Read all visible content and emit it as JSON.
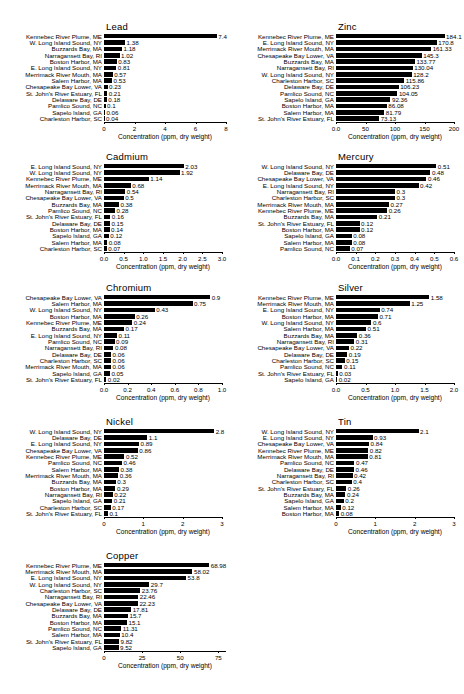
{
  "figure": {
    "axis_title": "Concentration (ppm, dry weight)",
    "bar_color": "#000000"
  },
  "chart_data": [
    {
      "type": "bar",
      "title": "Lead",
      "orientation": "horizontal",
      "xlabel": "Concentration (ppm, dry weight)",
      "ylabel": "",
      "xlim": [
        0,
        8
      ],
      "xticks": [
        0,
        2,
        4,
        6,
        8
      ],
      "xticklabels": [
        "0",
        "2",
        "4",
        "6",
        "8"
      ],
      "grid": false,
      "legend": "none",
      "categories": [
        "Kennebec River Plume, ME",
        "W. Long Island Sound, NY",
        "Buzzards Bay, MA",
        "Narragansett Bay, RI",
        "Boston Harbor, MA",
        "E. Long Island Sound, NY",
        "Merrimack River Mouth, MA",
        "Salem Harbor, MA",
        "Chesapeake Bay Lower, VA",
        "St. John's River Estuary, FL",
        "Delaware Bay, DE",
        "Pamlico Sound, NC",
        "Sapelo Island, GA",
        "Charleston Harbor, SC"
      ],
      "values": [
        7.4,
        1.38,
        1.18,
        1.02,
        0.83,
        0.81,
        0.57,
        0.53,
        0.23,
        0.21,
        0.18,
        0.1,
        0.06,
        0.04
      ],
      "value_labels": [
        "7.4",
        "1.38",
        "1.18",
        "1.02",
        "0.83",
        "0.81",
        "0.57",
        "0.53",
        "0.23",
        "0.21",
        "0.18",
        "0.1",
        "0.06",
        "0.04"
      ]
    },
    {
      "type": "bar",
      "title": "Zinc",
      "orientation": "horizontal",
      "xlabel": "Concentration (ppm, dry weight)",
      "ylabel": "",
      "xlim": [
        0,
        200
      ],
      "xticks": [
        0,
        50,
        100,
        150,
        200
      ],
      "xticklabels": [
        "0.0",
        "50",
        "100",
        "150",
        "200"
      ],
      "grid": false,
      "legend": "none",
      "categories": [
        "Kennebec River Plume, ME",
        "E. Long Island Sound, NY",
        "Merrimack River Mouth, MA",
        "Chesapeake Bay Lower, VA",
        "Buzzards Bay, MA",
        "Narragansett Bay, RI",
        "W. Long Island Sound, NY",
        "Charleston Harbor, SC",
        "Delaware Bay, DE",
        "Pamlico Sound, NC",
        "Sapelo Island, GA",
        "Boston Harbor, MA",
        "Salem Harbor, MA",
        "St. John's River Estuary, FL"
      ],
      "values": [
        184.1,
        170.8,
        161.33,
        145.3,
        133.77,
        130.04,
        128.2,
        115.86,
        106.23,
        104.05,
        92.36,
        86.08,
        81.79,
        73.13
      ],
      "value_labels": [
        "184.1",
        "170.8",
        "161.33",
        "145.3",
        "133.77",
        "130.04",
        "128.2",
        "115.86",
        "106.23",
        "104.05",
        "92.36",
        "86.08",
        "81.79",
        "73.13"
      ]
    },
    {
      "type": "bar",
      "title": "Cadmium",
      "orientation": "horizontal",
      "xlabel": "Concentration (ppm, dry weight)",
      "ylabel": "",
      "xlim": [
        0,
        3.0
      ],
      "xticks": [
        0,
        0.5,
        1.0,
        1.5,
        2.0,
        2.5,
        3.0
      ],
      "xticklabels": [
        "0.0",
        "0.5",
        "1.0",
        "1.5",
        "2.0",
        "2.5",
        "3.0"
      ],
      "grid": false,
      "legend": "none",
      "categories": [
        "E. Long Island Sound, NY",
        "W. Long Island Sound, NY",
        "Kennebec River Plume, ME",
        "Merrimack River Mouth, MA",
        "Narragansett Bay, RI",
        "Chesapeake Bay Lower, VA",
        "Buzzards Bay, MA",
        "Pamlico Sound, NC",
        "St. John's River Estuary, FL",
        "Delaware Bay, DE",
        "Boston Harbor, MA",
        "Sapelo Island, GA",
        "Salem Harbor, MA",
        "Charleston Harbor, SC"
      ],
      "values": [
        2.03,
        1.92,
        1.14,
        0.68,
        0.54,
        0.5,
        0.38,
        0.28,
        0.16,
        0.15,
        0.14,
        0.12,
        0.08,
        0.07
      ],
      "value_labels": [
        "2.03",
        "1.92",
        "1.14",
        "0.68",
        "0.54",
        "0.5",
        "0.38",
        "0.28",
        "0.16",
        "0.15",
        "0.14",
        "0.12",
        "0.08",
        "0.07"
      ]
    },
    {
      "type": "bar",
      "title": "Mercury",
      "orientation": "horizontal",
      "xlabel": "Concentration (ppm, dry weight)",
      "ylabel": "",
      "xlim": [
        0,
        0.6
      ],
      "xticks": [
        0,
        0.1,
        0.2,
        0.3,
        0.4,
        0.5,
        0.6
      ],
      "xticklabels": [
        "0.0",
        "0.1",
        "0.2",
        "0.3",
        "0.4",
        "0.5",
        "0.6"
      ],
      "grid": false,
      "legend": "none",
      "categories": [
        "W. Long Island Sound, NY",
        "Delaware Bay, DE",
        "Chesapeake Bay Lower, VA",
        "E. Long Island Sound, NY",
        "Narragansett Bay, RI",
        "Charleston Harbor, SC",
        "Merrimack River Mouth, MA",
        "Kennebec River Plume, ME",
        "Buzzards Bay, MA",
        "St. John's River Estuary, FL",
        "Boston Harbor, MA",
        "Sapelo Island, GA",
        "Salem Harbor, MA",
        "Pamlico Sound, NC"
      ],
      "values": [
        0.51,
        0.48,
        0.46,
        0.42,
        0.3,
        0.3,
        0.27,
        0.26,
        0.21,
        0.12,
        0.12,
        0.08,
        0.08,
        0.07
      ],
      "value_labels": [
        "0.51",
        "0.48",
        "0.46",
        "0.42",
        "0.3",
        "0.3",
        "0.27",
        "0.26",
        "0.21",
        "0.12",
        "0.12",
        "0.08",
        "0.08",
        "0.07"
      ]
    },
    {
      "type": "bar",
      "title": "Chromium",
      "orientation": "horizontal",
      "xlabel": "Concentration (ppm, dry weight)",
      "ylabel": "",
      "xlim": [
        0,
        1.0
      ],
      "xticks": [
        0,
        0.2,
        0.4,
        0.6,
        0.8,
        1.0
      ],
      "xticklabels": [
        "0.0",
        "0.2",
        "0.4",
        "0.6",
        "0.8",
        "1.0"
      ],
      "grid": false,
      "legend": "none",
      "categories": [
        "Chesapeake Bay Lower, VA",
        "Salem Harbor, MA",
        "W. Long Island Sound, NY",
        "Boston Harbor, MA",
        "Kennebec River Plume, ME",
        "Buzzards Bay, MA",
        "E. Long Island Sound, NY",
        "Pamlico Sound, NC",
        "Narragansett Bay, RI",
        "Delaware Bay, DE",
        "Charleston Harbor, SC",
        "Merrimack River Mouth, MA",
        "Sapelo Island, GA",
        "St. John's River Estuary, FL"
      ],
      "values": [
        0.9,
        0.75,
        0.43,
        0.26,
        0.24,
        0.17,
        0.11,
        0.09,
        0.08,
        0.06,
        0.06,
        0.06,
        0.05,
        0.02
      ],
      "value_labels": [
        "0.9",
        "0.75",
        "0.43",
        "0.26",
        "0.24",
        "0.17",
        "0.11",
        "0.09",
        "0.08",
        "0.06",
        "0.06",
        "0.06",
        "0.05",
        "0.02"
      ]
    },
    {
      "type": "bar",
      "title": "Silver",
      "orientation": "horizontal",
      "xlabel": "Concentration (ppm, dry weight)",
      "ylabel": "",
      "xlim": [
        0,
        2.0
      ],
      "xticks": [
        0,
        0.5,
        1.0,
        1.5,
        2.0
      ],
      "xticklabels": [
        "0.0",
        "0.5",
        "1.0",
        "1.5",
        "2.0"
      ],
      "grid": false,
      "legend": "none",
      "categories": [
        "Kennebec River Plume, ME",
        "Merrimack River Mouth, MA",
        "E. Long Island Sound, NY",
        "Boston Harbor, MA",
        "W. Long Island Sound, NY",
        "Salem Harbor, MA",
        "Buzzards Bay, MA",
        "Narragansett Bay, RI",
        "Chesapeake Bay Lower, VA",
        "Delaware Bay, DE",
        "Charleston Harbor, SC",
        "Pamlico Sound, NC",
        "St. John's River Estuary, FL",
        "Sapelo Island, GA"
      ],
      "values": [
        1.58,
        1.25,
        0.74,
        0.71,
        0.6,
        0.51,
        0.36,
        0.31,
        0.22,
        0.19,
        0.15,
        0.11,
        0.03,
        0.02
      ],
      "value_labels": [
        "1.58",
        "1.25",
        "0.74",
        "0.71",
        "0.6",
        "0.51",
        "0.36",
        "0.31",
        "0.22",
        "0.19",
        "0.15",
        "0.11",
        "0.03",
        "0.02"
      ]
    },
    {
      "type": "bar",
      "title": "Nickel",
      "orientation": "horizontal",
      "xlabel": "Concentration (ppm, dry weight)",
      "ylabel": "",
      "xlim": [
        0,
        3
      ],
      "xticks": [
        0,
        1,
        2,
        3
      ],
      "xticklabels": [
        "0",
        "1",
        "2",
        "3"
      ],
      "grid": false,
      "legend": "none",
      "categories": [
        "W. Long Island Sound, NY",
        "Delaware Bay, DE",
        "E. Long Island Sound, NY",
        "Chesapeake Bay Lower, VA",
        "Kennebec River Plume, ME",
        "Pamlico Sound, NC",
        "Salem Harbor, MA",
        "Merrimack River Mouth, MA",
        "Buzzards Bay, MA",
        "Boston Harbor, MA",
        "Narragansett Bay, RI",
        "Sapelo Island, GA",
        "Charleston Harbor, SC",
        "St. John's River Estuary, FL"
      ],
      "values": [
        2.8,
        1.1,
        0.89,
        0.86,
        0.52,
        0.46,
        0.38,
        0.36,
        0.3,
        0.29,
        0.22,
        0.21,
        0.17,
        0.1
      ],
      "value_labels": [
        "2.8",
        "1.1",
        "0.89",
        "0.86",
        "0.52",
        "0.46",
        "0.38",
        "0.36",
        "0.3",
        "0.29",
        "0.22",
        "0.21",
        "0.17",
        "0.1"
      ]
    },
    {
      "type": "bar",
      "title": "Tin",
      "orientation": "horizontal",
      "xlabel": "Concentration (ppm, dry weight)",
      "ylabel": "",
      "xlim": [
        0,
        3
      ],
      "xticks": [
        0,
        1,
        2,
        3
      ],
      "xticklabels": [
        "0",
        "1",
        "2",
        "3"
      ],
      "grid": false,
      "legend": "none",
      "categories": [
        "W. Long Island Sound, NY",
        "E. Long Island Sound, NY",
        "Chesapeake Bay Lower, VA",
        "Kennebec River Plume, ME",
        "Merrimack River Mouth, MA",
        "Pamlico Sound, NC",
        "Delaware Bay, DE",
        "Narragansett Bay, RI",
        "Charleston Harbor, SC",
        "St. John's River Estuary, FL",
        "Buzzards Bay, MA",
        "Sapelo Island, GA",
        "Salem Harbor, MA",
        "Boston Harbor, MA"
      ],
      "values": [
        2.1,
        0.93,
        0.84,
        0.82,
        0.81,
        0.47,
        0.46,
        0.42,
        0.4,
        0.26,
        0.24,
        0.2,
        0.12,
        0.08
      ],
      "value_labels": [
        "2.1",
        "0.93",
        "0.84",
        "0.82",
        "0.81",
        "0.47",
        "0.46",
        "0.42",
        "0.4",
        "0.26",
        "0.24",
        "0.2",
        "0.12",
        "0.08"
      ]
    },
    {
      "type": "bar",
      "title": "Copper",
      "orientation": "horizontal",
      "xlabel": "Concentration (ppm, dry weight)",
      "ylabel": "",
      "xlim": [
        0,
        80
      ],
      "xticks": [
        0,
        25,
        50,
        75
      ],
      "xticklabels": [
        "0",
        "25",
        "50",
        "75"
      ],
      "grid": false,
      "legend": "none",
      "categories": [
        "Kennebec River Plume, ME",
        "Merrimack River Mouth, MA",
        "E. Long Island Sound, NY",
        "W. Long Island Sound, NY",
        "Charleston Harbor, SC",
        "Narragansett Bay, RI",
        "Chesapeake Bay Lower, VA",
        "Delaware Bay, DE",
        "Buzzards Bay, MA",
        "Boston Harbor, MA",
        "Pamlico Sound, NC",
        "Salem Harbor, MA",
        "St. John's River Estuary, FL",
        "Sapelo Island, GA"
      ],
      "values": [
        68.98,
        58.02,
        53.8,
        29.7,
        23.76,
        22.46,
        22.23,
        17.81,
        15.7,
        15.1,
        11.31,
        10.4,
        9.82,
        9.52
      ],
      "value_labels": [
        "68.98",
        "58.02",
        "53.8",
        "29.7",
        "23.76",
        "22.46",
        "22.23",
        "17.81",
        "15.7",
        "15.1",
        "11.31",
        "10.4",
        "9.82",
        "9.52"
      ]
    }
  ],
  "panels": [
    {
      "id": "lead",
      "left": 4,
      "top": 22,
      "width": 228,
      "height": 128,
      "plot_left": 100,
      "plot_width": 122
    },
    {
      "id": "zinc",
      "left": 236,
      "top": 22,
      "width": 228,
      "height": 128,
      "plot_left": 100,
      "plot_width": 118
    },
    {
      "id": "cadmium",
      "left": 4,
      "top": 152,
      "width": 228,
      "height": 128,
      "plot_left": 100,
      "plot_width": 118
    },
    {
      "id": "mercury",
      "left": 236,
      "top": 152,
      "width": 228,
      "height": 128,
      "plot_left": 100,
      "plot_width": 118
    },
    {
      "id": "chromium",
      "left": 4,
      "top": 283,
      "width": 228,
      "height": 130,
      "plot_left": 100,
      "plot_width": 118
    },
    {
      "id": "silver",
      "left": 236,
      "top": 283,
      "width": 228,
      "height": 130,
      "plot_left": 100,
      "plot_width": 118
    },
    {
      "id": "nickel",
      "left": 4,
      "top": 417,
      "width": 228,
      "height": 130,
      "plot_left": 100,
      "plot_width": 118
    },
    {
      "id": "tin",
      "left": 236,
      "top": 417,
      "width": 228,
      "height": 130,
      "plot_left": 100,
      "plot_width": 118
    },
    {
      "id": "copper",
      "left": 4,
      "top": 551,
      "width": 228,
      "height": 132,
      "plot_left": 100,
      "plot_width": 122
    }
  ]
}
